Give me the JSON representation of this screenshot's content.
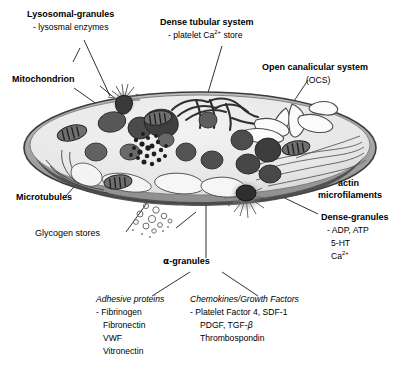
{
  "figure": {
    "background_color": "#ffffff",
    "membrane_color": "#555555",
    "cytoplasm_color": "#e9e9e9",
    "granule_color": "#4a4a4a"
  },
  "labels": {
    "lysosomal_granules": {
      "title": "Lysosomal-granules",
      "detail": "- lysosmal enzymes"
    },
    "mitochondrion": {
      "title": "Mitochondrion"
    },
    "dense_tubular_system": {
      "title": "Dense tubular system",
      "detail_pre": "- platelet Ca",
      "detail_sup": "2+",
      "detail_post": " store"
    },
    "open_canalicular_system": {
      "title": "Open canalicular system",
      "abbrev": "(OCS)"
    },
    "actin_microfilaments": {
      "line1": "actin",
      "line2": "microfilaments"
    },
    "dense_granules": {
      "title": "Dense-granules",
      "items": [
        "- ADP, ATP",
        "5-HT"
      ],
      "item_ca_pre": "Ca",
      "item_ca_sup": "2+"
    },
    "microtubules": {
      "title": "Microtubules"
    },
    "glycogen_stores": {
      "title": "Glycogen stores"
    },
    "alpha_granules": {
      "symbol": "α",
      "title": "-granules"
    },
    "adhesive_proteins": {
      "heading": "Adhesive proteins",
      "items": [
        "- Fibrinogen",
        "Fibronectin",
        "VWF",
        "Vitronectin"
      ]
    },
    "chemokines_growth_factors": {
      "heading": "Chemokines/Growth Factors",
      "items": [
        "- Platelet Factor 4, SDF-1"
      ],
      "item_pdgf_pre": "PDGF, TGF-",
      "item_pdgf_beta": "β",
      "item_thrombospondin": "Thrombospondin"
    }
  }
}
